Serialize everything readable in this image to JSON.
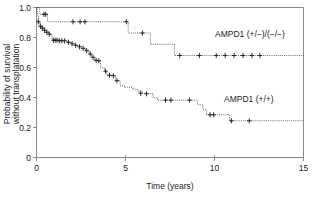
{
  "figure": {
    "background_color": "#ffffff",
    "frame_color": "#8a8a8a",
    "curve_color": "#2b2b2b"
  },
  "axes": {
    "x_title": "Time (years)",
    "y_title_line1": "Probability of survival",
    "y_title_line2": "without transplatation",
    "x_ticks": [
      "0",
      "5",
      "10",
      "15"
    ],
    "y_ticks": [
      "0",
      "0.2",
      "0.4",
      "0.6",
      "0.8",
      "1.0"
    ]
  },
  "labels": {
    "series_upper": "AMPD1 (+/−)/(−/−)",
    "series_lower": "AMPD1 (+/+)"
  },
  "chart_data": {
    "type": "line",
    "subtype": "kaplan-meier-step",
    "title": "",
    "xlabel": "Time (years)",
    "ylabel": "Probability of survival without transplatation",
    "xlim": [
      0,
      15
    ],
    "ylim": [
      0,
      1.0
    ],
    "xticks": [
      0,
      5,
      10,
      15
    ],
    "yticks": [
      0,
      0.2,
      0.4,
      0.6,
      0.8,
      1.0
    ],
    "grid": false,
    "legend_position": "inline-annotation",
    "series": [
      {
        "name": "AMPD1 (+/−)/(−/−)",
        "final_value": 0.68,
        "steps": [
          [
            0.0,
            1.0
          ],
          [
            0.18,
            0.955
          ],
          [
            0.55,
            0.955
          ],
          [
            0.62,
            0.905
          ],
          [
            5.1,
            0.905
          ],
          [
            5.15,
            0.83
          ],
          [
            6.35,
            0.83
          ],
          [
            6.4,
            0.755
          ],
          [
            7.7,
            0.755
          ],
          [
            7.75,
            0.68
          ],
          [
            15.0,
            0.68
          ]
        ],
        "censor_marks": [
          [
            0.42,
            0.955
          ],
          [
            0.52,
            0.955
          ],
          [
            2.05,
            0.905
          ],
          [
            2.45,
            0.905
          ],
          [
            2.72,
            0.905
          ],
          [
            5.05,
            0.905
          ],
          [
            5.95,
            0.83
          ],
          [
            8.05,
            0.68
          ],
          [
            9.15,
            0.68
          ],
          [
            10.1,
            0.68
          ],
          [
            10.6,
            0.68
          ],
          [
            11.1,
            0.68
          ],
          [
            11.6,
            0.68
          ],
          [
            12.1,
            0.68
          ],
          [
            12.55,
            0.68
          ]
        ]
      },
      {
        "name": "AMPD1 (+/+)",
        "final_value": 0.245,
        "steps": [
          [
            0.0,
            1.0
          ],
          [
            0.05,
            0.95
          ],
          [
            0.12,
            0.9
          ],
          [
            0.2,
            0.875
          ],
          [
            0.3,
            0.865
          ],
          [
            0.42,
            0.85
          ],
          [
            0.55,
            0.838
          ],
          [
            0.68,
            0.828
          ],
          [
            0.78,
            0.818
          ],
          [
            0.88,
            0.782
          ],
          [
            1.55,
            0.778
          ],
          [
            1.75,
            0.768
          ],
          [
            1.95,
            0.758
          ],
          [
            2.15,
            0.748
          ],
          [
            2.35,
            0.738
          ],
          [
            2.55,
            0.728
          ],
          [
            2.75,
            0.712
          ],
          [
            2.95,
            0.69
          ],
          [
            3.1,
            0.668
          ],
          [
            3.25,
            0.648
          ],
          [
            3.45,
            0.645
          ],
          [
            3.6,
            0.598
          ],
          [
            3.82,
            0.575
          ],
          [
            3.95,
            0.548
          ],
          [
            4.25,
            0.545
          ],
          [
            4.45,
            0.512
          ],
          [
            4.7,
            0.478
          ],
          [
            4.95,
            0.468
          ],
          [
            5.4,
            0.455
          ],
          [
            5.7,
            0.442
          ],
          [
            5.95,
            0.428
          ],
          [
            6.3,
            0.425
          ],
          [
            6.55,
            0.398
          ],
          [
            6.8,
            0.382
          ],
          [
            8.95,
            0.382
          ],
          [
            9.05,
            0.352
          ],
          [
            9.35,
            0.318
          ],
          [
            9.55,
            0.285
          ],
          [
            10.75,
            0.285
          ],
          [
            10.85,
            0.245
          ],
          [
            15.0,
            0.245
          ]
        ],
        "censor_marks": [
          [
            0.1,
            0.905
          ],
          [
            0.22,
            0.875
          ],
          [
            0.33,
            0.862
          ],
          [
            0.45,
            0.848
          ],
          [
            0.58,
            0.835
          ],
          [
            0.72,
            0.822
          ],
          [
            0.95,
            0.782
          ],
          [
            1.05,
            0.782
          ],
          [
            1.15,
            0.782
          ],
          [
            1.28,
            0.778
          ],
          [
            1.42,
            0.778
          ],
          [
            1.58,
            0.778
          ],
          [
            1.8,
            0.768
          ],
          [
            2.0,
            0.758
          ],
          [
            2.2,
            0.748
          ],
          [
            2.42,
            0.738
          ],
          [
            2.62,
            0.728
          ],
          [
            2.82,
            0.712
          ],
          [
            3.02,
            0.69
          ],
          [
            3.18,
            0.668
          ],
          [
            3.35,
            0.648
          ],
          [
            3.5,
            0.645
          ],
          [
            3.88,
            0.575
          ],
          [
            4.1,
            0.548
          ],
          [
            4.32,
            0.545
          ],
          [
            4.52,
            0.512
          ],
          [
            5.85,
            0.428
          ],
          [
            6.18,
            0.425
          ],
          [
            7.25,
            0.382
          ],
          [
            7.55,
            0.382
          ],
          [
            8.6,
            0.382
          ],
          [
            9.75,
            0.285
          ],
          [
            9.95,
            0.285
          ],
          [
            10.95,
            0.245
          ],
          [
            11.95,
            0.245
          ]
        ]
      }
    ]
  }
}
